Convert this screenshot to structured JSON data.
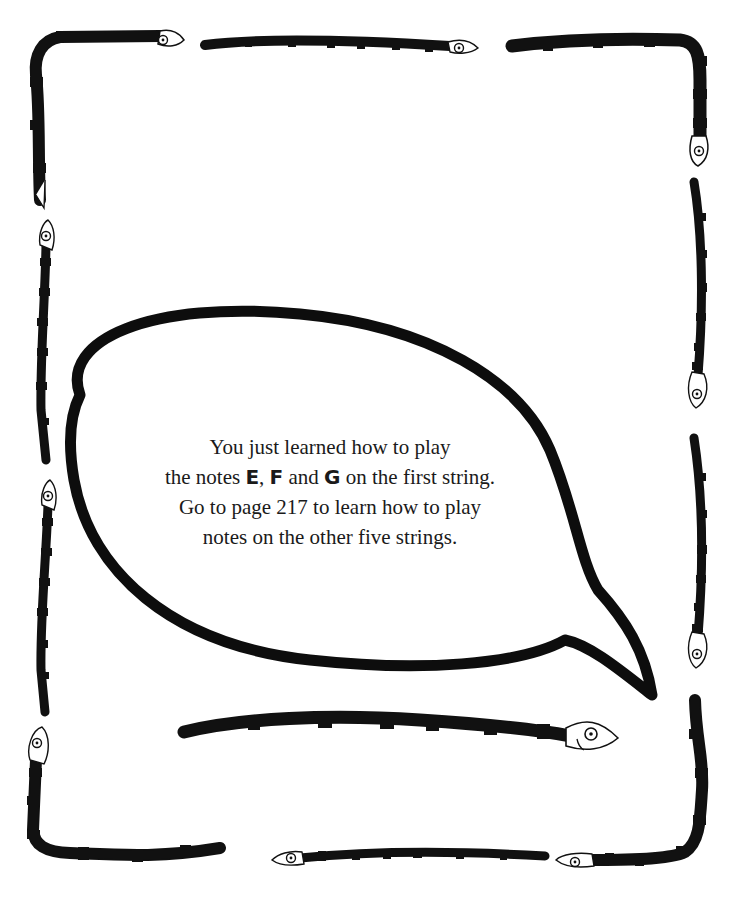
{
  "page": {
    "background": "#ffffff",
    "ink_color": "#111111"
  },
  "speech_bubble": {
    "lines": [
      {
        "text": "You just learned how to play"
      },
      {
        "before": "the notes ",
        "note1": "E",
        "sep1": ", ",
        "note2": "F",
        "sep2": " and ",
        "note3": "G",
        "after": " on the first string."
      },
      {
        "text": "Go to page 217 to learn how to play"
      },
      {
        "text": "notes on the other five strings."
      }
    ],
    "notes": [
      "E",
      "F",
      "G"
    ],
    "page_reference": "217"
  },
  "border": {
    "decoration": "striped snakes",
    "snake_count": 12
  }
}
